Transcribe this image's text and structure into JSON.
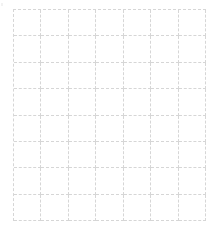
{
  "grid": {
    "columns": 7,
    "rows": 8,
    "line_color": "#d6d6d6",
    "background_color": "#ffffff",
    "cells": [
      [
        "",
        "",
        "",
        "",
        "",
        "",
        ""
      ],
      [
        "",
        "",
        "",
        "",
        "",
        "",
        ""
      ],
      [
        "",
        "",
        "",
        "",
        "",
        "",
        ""
      ],
      [
        "",
        "",
        "",
        "",
        "",
        "",
        ""
      ],
      [
        "",
        "",
        "",
        "",
        "",
        "",
        ""
      ],
      [
        "",
        "",
        "",
        "",
        "",
        "",
        ""
      ],
      [
        "",
        "",
        "",
        "",
        "",
        "",
        ""
      ],
      [
        "",
        "",
        "",
        "",
        "",
        "",
        ""
      ]
    ]
  }
}
